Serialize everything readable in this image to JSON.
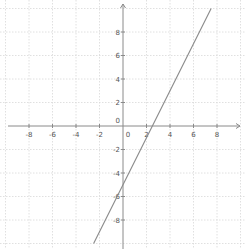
{
  "chart_data": {
    "type": "line",
    "title": "",
    "xlabel": "",
    "ylabel": "",
    "xlim": [
      -10,
      10
    ],
    "ylim": [
      -10,
      10
    ],
    "grid": true,
    "grid_step": 2,
    "x_ticks": [
      -8,
      -6,
      -4,
      -2,
      0,
      2,
      4,
      6,
      8
    ],
    "y_ticks": [
      -8,
      -6,
      -4,
      -2,
      0,
      2,
      4,
      6,
      8
    ],
    "x_tick_labels": [
      "-8",
      "-6",
      "-4",
      "-2",
      "0",
      "2",
      "4",
      "6",
      "8"
    ],
    "y_tick_labels": [
      "-8",
      "-6",
      "-4",
      "-2",
      "0",
      "2",
      "4",
      "6",
      "8"
    ],
    "series": [
      {
        "name": "y = 2x - 5",
        "slope": 2,
        "intercept": -5,
        "x": [
          -2.5,
          7.5
        ],
        "y": [
          -10,
          10
        ],
        "color": "#8a8a8a"
      }
    ],
    "legend": null
  },
  "layout": {
    "origin_px": [
      123,
      126
    ],
    "px_per_unit": 11.75,
    "x_axis_px_range": [
      8,
      240
    ],
    "y_axis_px_range": [
      4,
      249
    ],
    "colors": {
      "axis": "#8a8a8a",
      "grid": "#d8d8d8",
      "line": "#8a8a8a",
      "label": "#555555"
    }
  }
}
